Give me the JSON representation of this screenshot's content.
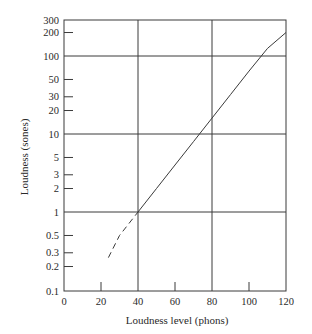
{
  "chart_data": {
    "type": "line",
    "title": "",
    "xlabel": "Loudness level (phons)",
    "ylabel": "Loudness  (sones)",
    "xlim": [
      0,
      120
    ],
    "ylim": [
      0.1,
      300
    ],
    "yscale": "log",
    "grid": true,
    "x_gridlines": [
      40,
      80
    ],
    "y_gridlines": [
      1,
      10,
      100
    ],
    "x_ticks": [
      0,
      20,
      40,
      60,
      80,
      100,
      120
    ],
    "x_tick_labels": [
      "0",
      "20",
      "40",
      "60",
      "80",
      "100",
      "120"
    ],
    "y_ticks": [
      0.1,
      0.2,
      0.3,
      0.5,
      1,
      2,
      3,
      5,
      10,
      20,
      30,
      50,
      100,
      200,
      300
    ],
    "y_tick_labels": [
      "0.1",
      "0.2",
      "0.3",
      "0.5",
      "1",
      "2",
      "3",
      "5",
      "10",
      "20",
      "30",
      "50",
      "100",
      "200",
      "300"
    ],
    "legend": null,
    "series": [
      {
        "name": "Loudness (extrapolated)",
        "style": "dashed",
        "x": [
          24,
          30,
          40
        ],
        "y": [
          0.26,
          0.5,
          1
        ]
      },
      {
        "name": "Loudness",
        "style": "solid",
        "x": [
          40,
          50,
          60,
          70,
          80,
          90,
          100,
          110,
          120
        ],
        "y": [
          1,
          2,
          4,
          8,
          16,
          32,
          64,
          125,
          200
        ]
      }
    ]
  },
  "colors": {
    "line": "#3a3a3a",
    "grid": "#3a3a3a",
    "text": "#2a2a2a"
  }
}
